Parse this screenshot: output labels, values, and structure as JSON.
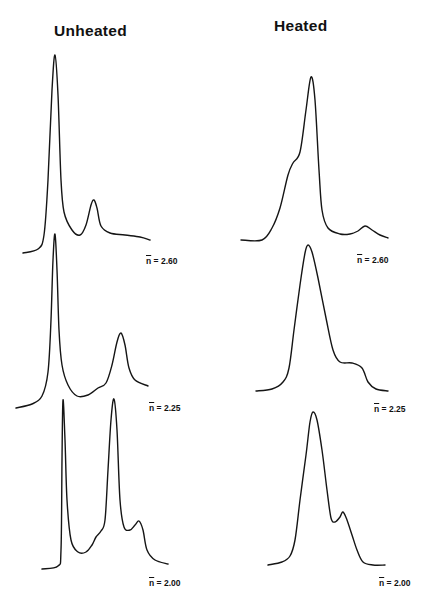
{
  "columns": {
    "unheated": {
      "title": "Unheated"
    },
    "heated": {
      "title": "Heated"
    }
  },
  "labels": {
    "n_symbol": "n",
    "unheated": [
      {
        "text": "= 2.60"
      },
      {
        "text": "= 2.25"
      },
      {
        "text": "= 2.00"
      }
    ],
    "heated": [
      {
        "text": "= 2.60"
      },
      {
        "text": "= 2.25"
      },
      {
        "text": "= 2.00"
      }
    ]
  },
  "colors": {
    "trace": "#151515",
    "background": "#ffffff"
  },
  "chart_data": {
    "type": "line",
    "title": "",
    "subtitle": "Unheated vs Heated distributions at different n̄",
    "xlabel": "",
    "ylabel": "",
    "grid": false,
    "legend": "none",
    "layout": "3 rows x 2 columns small multiples; columns: Unheated, Heated; rows: n̄ = 2.60, 2.25, 2.00",
    "panels": [
      {
        "column": "Unheated",
        "n_bar": 2.6,
        "description": "very sharp tall main peak, small secondary peak, flat tail",
        "peaks_relative_height": [
          1.0,
          0.19
        ],
        "points_px": [
          [
            23,
            253
          ],
          [
            38,
            249
          ],
          [
            44,
            235
          ],
          [
            48,
            180
          ],
          [
            52,
            90
          ],
          [
            55,
            55
          ],
          [
            58,
            95
          ],
          [
            61,
            180
          ],
          [
            64,
            212
          ],
          [
            72,
            230
          ],
          [
            80,
            235
          ],
          [
            86,
            225
          ],
          [
            91,
            205
          ],
          [
            94,
            200
          ],
          [
            97,
            208
          ],
          [
            101,
            226
          ],
          [
            110,
            233
          ],
          [
            125,
            235
          ],
          [
            140,
            237
          ],
          [
            150,
            240
          ]
        ]
      },
      {
        "column": "Heated",
        "n_bar": 2.6,
        "description": "single broad peak with left shoulder, small bump on right tail",
        "peaks_relative_height": [
          1.0,
          0.1
        ],
        "points_px": [
          [
            241,
            240
          ],
          [
            262,
            240
          ],
          [
            272,
            228
          ],
          [
            280,
            208
          ],
          [
            288,
            175
          ],
          [
            293,
            163
          ],
          [
            300,
            152
          ],
          [
            306,
            110
          ],
          [
            311,
            77
          ],
          [
            315,
            100
          ],
          [
            319,
            170
          ],
          [
            322,
            210
          ],
          [
            328,
            228
          ],
          [
            340,
            234
          ],
          [
            350,
            234
          ],
          [
            358,
            231
          ],
          [
            365,
            226
          ],
          [
            372,
            230
          ],
          [
            380,
            235
          ],
          [
            388,
            238
          ]
        ]
      },
      {
        "column": "Unheated",
        "n_bar": 2.25,
        "description": "very sharp tall main peak, moderate secondary peak",
        "peaks_relative_height": [
          1.0,
          0.42
        ],
        "points_px": [
          [
            16,
            408
          ],
          [
            32,
            404
          ],
          [
            42,
            396
          ],
          [
            48,
            372
          ],
          [
            51,
            320
          ],
          [
            53,
            260
          ],
          [
            55,
            234
          ],
          [
            57,
            270
          ],
          [
            59,
            330
          ],
          [
            62,
            365
          ],
          [
            68,
            385
          ],
          [
            77,
            396
          ],
          [
            88,
            395
          ],
          [
            98,
            388
          ],
          [
            106,
            383
          ],
          [
            112,
            365
          ],
          [
            117,
            342
          ],
          [
            121,
            333
          ],
          [
            125,
            345
          ],
          [
            129,
            368
          ],
          [
            135,
            380
          ],
          [
            148,
            386
          ]
        ]
      },
      {
        "column": "Heated",
        "n_bar": 2.25,
        "description": "single broad asymmetric peak with right shoulder",
        "peaks_relative_height": [
          1.0,
          0.2
        ],
        "points_px": [
          [
            256,
            391
          ],
          [
            272,
            389
          ],
          [
            283,
            382
          ],
          [
            289,
            368
          ],
          [
            294,
            330
          ],
          [
            300,
            285
          ],
          [
            305,
            253
          ],
          [
            308,
            245
          ],
          [
            312,
            252
          ],
          [
            318,
            278
          ],
          [
            326,
            318
          ],
          [
            333,
            350
          ],
          [
            340,
            362
          ],
          [
            352,
            363
          ],
          [
            362,
            368
          ],
          [
            368,
            382
          ],
          [
            376,
            389
          ],
          [
            388,
            391
          ]
        ]
      },
      {
        "column": "Unheated",
        "n_bar": 2.0,
        "description": "two sharp tall peaks of similar height, small third peak",
        "peaks_relative_height": [
          1.0,
          1.0,
          0.28
        ],
        "points_px": [
          [
            42,
            569
          ],
          [
            58,
            566
          ],
          [
            61,
            550
          ],
          [
            62,
            460
          ],
          [
            63,
            400
          ],
          [
            65,
            440
          ],
          [
            67,
            500
          ],
          [
            71,
            540
          ],
          [
            78,
            552
          ],
          [
            86,
            552
          ],
          [
            92,
            545
          ],
          [
            96,
            537
          ],
          [
            101,
            531
          ],
          [
            105,
            520
          ],
          [
            108,
            470
          ],
          [
            111,
            420
          ],
          [
            114,
            399
          ],
          [
            117,
            430
          ],
          [
            120,
            500
          ],
          [
            124,
            527
          ],
          [
            130,
            530
          ],
          [
            135,
            525
          ],
          [
            139,
            521
          ],
          [
            143,
            530
          ],
          [
            147,
            550
          ],
          [
            155,
            560
          ],
          [
            168,
            564
          ]
        ]
      },
      {
        "column": "Heated",
        "n_bar": 2.0,
        "description": "single broad peak with secondary shoulder peak on right",
        "peaks_relative_height": [
          1.0,
          0.28
        ],
        "points_px": [
          [
            268,
            565
          ],
          [
            282,
            562
          ],
          [
            290,
            556
          ],
          [
            295,
            540
          ],
          [
            300,
            500
          ],
          [
            306,
            455
          ],
          [
            310,
            422
          ],
          [
            313,
            412
          ],
          [
            317,
            420
          ],
          [
            322,
            450
          ],
          [
            327,
            490
          ],
          [
            331,
            518
          ],
          [
            335,
            522
          ],
          [
            340,
            517
          ],
          [
            343,
            512
          ],
          [
            347,
            520
          ],
          [
            352,
            535
          ],
          [
            357,
            550
          ],
          [
            363,
            562
          ],
          [
            373,
            565
          ],
          [
            385,
            565
          ]
        ]
      }
    ]
  }
}
